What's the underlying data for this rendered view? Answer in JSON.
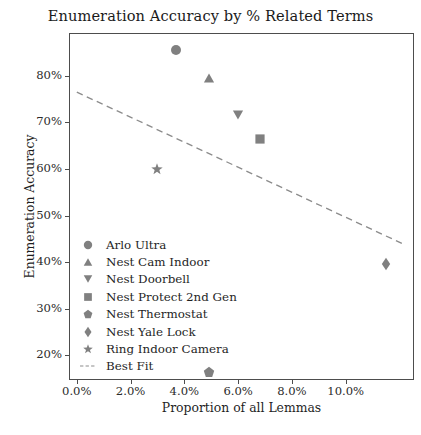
{
  "chart_data": {
    "type": "scatter",
    "title": "Enumeration Accuracy by % Related Terms",
    "xlabel": "Proportion of all Lemmas",
    "ylabel": "Enumeration Accuracy",
    "xlim": [
      -0.0029,
      0.1254
    ],
    "ylim": [
      0.147,
      0.892
    ],
    "grid": false,
    "legend_position": "lower-left-inside",
    "xtick_labels": [
      "0.0%",
      "2.0%",
      "4.0%",
      "6.0%",
      "8.0%",
      "10.0%"
    ],
    "xtick_values": [
      0.0,
      0.02,
      0.04,
      0.06,
      0.08,
      0.1
    ],
    "ytick_labels": [
      "20%",
      "30%",
      "40%",
      "50%",
      "60%",
      "70%",
      "80%"
    ],
    "ytick_values": [
      0.2,
      0.3,
      0.4,
      0.5,
      0.6,
      0.7,
      0.8
    ],
    "marker_color": "#808080",
    "line_color": "#8c8c8c",
    "axis_color": "#4d4d4d",
    "points": [
      {
        "name": "Arlo Ultra",
        "marker": "circle",
        "x": 0.037,
        "y": 0.855
      },
      {
        "name": "Nest Cam Indoor",
        "marker": "triangle-up",
        "x": 0.049,
        "y": 0.795
      },
      {
        "name": "Nest Doorbell",
        "marker": "triangle-down",
        "x": 0.06,
        "y": 0.715
      },
      {
        "name": "Nest Protect 2nd Gen",
        "marker": "square",
        "x": 0.068,
        "y": 0.665
      },
      {
        "name": "Nest Thermostat",
        "marker": "pentagon",
        "x": 0.049,
        "y": 0.165
      },
      {
        "name": "Nest Yale Lock",
        "marker": "diamond",
        "x": 0.115,
        "y": 0.395
      },
      {
        "name": "Ring Indoor Camera",
        "marker": "star",
        "x": 0.03,
        "y": 0.6
      }
    ],
    "best_fit": {
      "label": "Best Fit",
      "style": "dashed",
      "x_start": 0.0,
      "y_start": 0.765,
      "x_end": 0.121,
      "y_end": 0.44
    }
  },
  "legend": {
    "items": [
      {
        "label": "Arlo Ultra",
        "marker": "circle"
      },
      {
        "label": "Nest Cam Indoor",
        "marker": "triangle-up"
      },
      {
        "label": "Nest Doorbell",
        "marker": "triangle-down"
      },
      {
        "label": "Nest Protect 2nd Gen",
        "marker": "square"
      },
      {
        "label": "Nest Thermostat",
        "marker": "pentagon"
      },
      {
        "label": "Nest Yale Lock",
        "marker": "diamond"
      },
      {
        "label": "Ring Indoor Camera",
        "marker": "star"
      },
      {
        "label": "Best Fit",
        "marker": "dashed-line"
      }
    ]
  }
}
